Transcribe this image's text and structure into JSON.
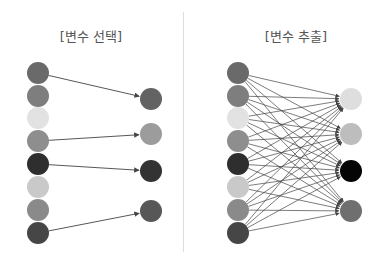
{
  "panels": [
    {
      "title": "[변수 선택]",
      "kind": "selection",
      "inputs": [
        {
          "y": 73,
          "color": "#6a6a6a"
        },
        {
          "y": 96,
          "color": "#7e7e7e"
        },
        {
          "y": 118,
          "color": "#e2e2e2"
        },
        {
          "y": 141,
          "color": "#8e8e8e"
        },
        {
          "y": 164,
          "color": "#2e2e2e"
        },
        {
          "y": 187,
          "color": "#c9c9c9"
        },
        {
          "y": 210,
          "color": "#8a8a8a"
        },
        {
          "y": 233,
          "color": "#464646"
        }
      ],
      "outputs": [
        {
          "y": 99,
          "color": "#636363"
        },
        {
          "y": 134,
          "color": "#9c9c9c"
        },
        {
          "y": 171,
          "color": "#333333"
        },
        {
          "y": 211,
          "color": "#575757"
        }
      ],
      "edges": [
        [
          0,
          0
        ],
        [
          3,
          1
        ],
        [
          4,
          2
        ],
        [
          7,
          3
        ]
      ],
      "input_x": 38,
      "output_x": 151
    },
    {
      "title": "[변수 추출]",
      "kind": "extraction",
      "inputs": [
        {
          "y": 73,
          "color": "#6a6a6a"
        },
        {
          "y": 96,
          "color": "#7e7e7e"
        },
        {
          "y": 118,
          "color": "#e2e2e2"
        },
        {
          "y": 141,
          "color": "#8e8e8e"
        },
        {
          "y": 164,
          "color": "#2e2e2e"
        },
        {
          "y": 187,
          "color": "#c9c9c9"
        },
        {
          "y": 210,
          "color": "#8a8a8a"
        },
        {
          "y": 233,
          "color": "#464646"
        }
      ],
      "outputs": [
        {
          "y": 99,
          "color": "#dedede"
        },
        {
          "y": 134,
          "color": "#bdbdbd"
        },
        {
          "y": 171,
          "color": "#050505"
        },
        {
          "y": 211,
          "color": "#6f6f6f"
        }
      ],
      "edges": "all",
      "input_x": 238,
      "output_x": 351
    }
  ],
  "style": {
    "node_radius": 11,
    "edge_color": "#444444",
    "divider_color": "#dddddd",
    "title_color": "#555555"
  }
}
